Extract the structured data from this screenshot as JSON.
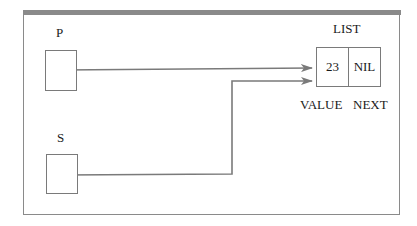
{
  "diagram": {
    "type": "linked-list-pointer-diagram",
    "pointers": [
      {
        "name": "P",
        "points_to": "LIST"
      },
      {
        "name": "S",
        "points_to": "LIST"
      }
    ],
    "node": {
      "title": "LIST",
      "fields": [
        {
          "label": "VALUE",
          "value": "23"
        },
        {
          "label": "NEXT",
          "value": "NIL"
        }
      ]
    },
    "colors": {
      "line": "#7a7a7a",
      "frame": "#8a8a8a",
      "text": "#1a1a1a"
    }
  }
}
